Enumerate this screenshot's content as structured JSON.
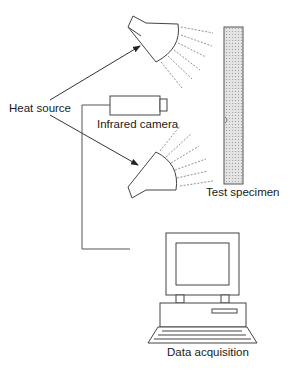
{
  "diagram": {
    "type": "experimental-setup",
    "labels": {
      "heat_source": "Heat source",
      "infrared_camera": "Infrared camera",
      "test_specimen": "Test specimen",
      "data_acquisition": "Data acquisition"
    },
    "components": [
      {
        "name": "heat-lamp-upper",
        "role": "Heat source"
      },
      {
        "name": "heat-lamp-lower",
        "role": "Heat source"
      },
      {
        "name": "infrared-camera",
        "role": "Infrared camera"
      },
      {
        "name": "test-specimen",
        "role": "Test specimen"
      },
      {
        "name": "computer",
        "role": "Data acquisition"
      }
    ],
    "connections": [
      {
        "from": "Heat source",
        "to": "heat-lamp-upper",
        "type": "arrow"
      },
      {
        "from": "Heat source",
        "to": "heat-lamp-lower",
        "type": "arrow"
      },
      {
        "from": "infrared-camera",
        "to": "computer",
        "type": "cable"
      }
    ],
    "colors": {
      "line": "#333333",
      "specimen_fill": "#d9d9d9"
    }
  }
}
